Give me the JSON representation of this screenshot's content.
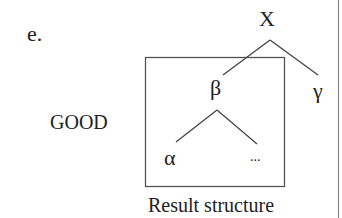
{
  "example_label": "e.",
  "judgment_label": "GOOD",
  "caption": "Result structure",
  "tree": {
    "root": "X",
    "children": [
      {
        "label": "β",
        "boxed": true,
        "children": [
          {
            "label": "α"
          },
          {
            "label": "..."
          }
        ]
      },
      {
        "label": "γ"
      }
    ]
  },
  "colors": {
    "text": "#222222",
    "lines": "#444444",
    "box": "#555555",
    "rule": "#888888"
  }
}
